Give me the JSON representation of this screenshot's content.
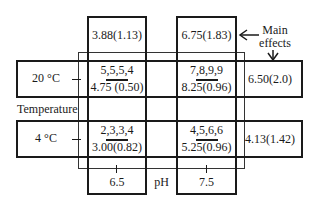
{
  "factor_row": {
    "label": "Temperature",
    "levels": [
      {
        "label": "20 °C",
        "main_effect": "6.50(2.0)"
      },
      {
        "label": "4 °C",
        "main_effect": "4.13(1.42)"
      }
    ]
  },
  "factor_col": {
    "label": "pH",
    "levels": [
      {
        "label": "6.5",
        "main_effect": "3.88(1.13)"
      },
      {
        "label": "7.5",
        "main_effect": "6.75(1.83)"
      }
    ]
  },
  "cells": [
    {
      "row": "20 °C",
      "col": "6.5",
      "data": "5,5,5,4",
      "summary": "4.75 (0.50)"
    },
    {
      "row": "20 °C",
      "col": "7.5",
      "data": "7,8,9,9",
      "summary": "8.25(0.96)"
    },
    {
      "row": "4 °C",
      "col": "6.5",
      "data": "2,3,3,4",
      "summary": "3.00(0.82)"
    },
    {
      "row": "4 °C",
      "col": "7.5",
      "data": "4,5,6,6",
      "summary": "5.25(0.96)"
    }
  ],
  "annotation": {
    "line1": "Main",
    "line2": "effects"
  }
}
